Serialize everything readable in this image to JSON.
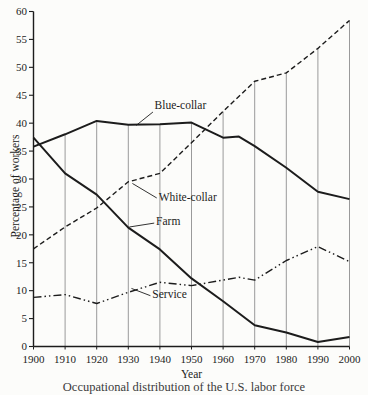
{
  "figure": {
    "background": "#fcfcfa",
    "ink": "#1c1c1c",
    "grid_color": "#8f8f8f"
  },
  "chart_data": {
    "type": "line",
    "title": "",
    "xlabel": "Year",
    "ylabel": "Percentage of workers",
    "xlim": [
      1900,
      2000
    ],
    "ylim": [
      0,
      60
    ],
    "x_ticks": [
      1900,
      1910,
      1920,
      1930,
      1940,
      1950,
      1960,
      1970,
      1980,
      1990,
      2000
    ],
    "y_ticks": [
      0,
      5,
      10,
      15,
      20,
      25,
      30,
      35,
      40,
      45,
      50,
      55,
      60
    ],
    "grid": "vertical guide line at each decade from x-axis up to highest curve",
    "legend_position": "inline-labels",
    "series": [
      {
        "name": "Blue-collar",
        "style": "solid",
        "width": 2,
        "points": [
          [
            1900,
            35.8
          ],
          [
            1910,
            38.0
          ],
          [
            1920,
            40.4
          ],
          [
            1930,
            39.7
          ],
          [
            1940,
            39.8
          ],
          [
            1950,
            40.1
          ],
          [
            1960,
            37.4
          ],
          [
            1965,
            37.6
          ],
          [
            1970,
            35.9
          ],
          [
            1980,
            32.0
          ],
          [
            1990,
            27.7
          ],
          [
            2000,
            26.4
          ]
        ]
      },
      {
        "name": "White-collar",
        "style": "dashed",
        "width": 1.4,
        "points": [
          [
            1900,
            17.5
          ],
          [
            1910,
            21.4
          ],
          [
            1920,
            24.8
          ],
          [
            1930,
            29.5
          ],
          [
            1940,
            31.0
          ],
          [
            1950,
            36.5
          ],
          [
            1960,
            42.1
          ],
          [
            1970,
            47.5
          ],
          [
            1980,
            49.0
          ],
          [
            1990,
            53.4
          ],
          [
            2000,
            58.4
          ]
        ]
      },
      {
        "name": "Farm",
        "style": "solid",
        "width": 2,
        "points": [
          [
            1900,
            37.4
          ],
          [
            1910,
            31.0
          ],
          [
            1920,
            27.2
          ],
          [
            1930,
            21.3
          ],
          [
            1940,
            17.4
          ],
          [
            1950,
            12.2
          ],
          [
            1960,
            8.1
          ],
          [
            1970,
            3.8
          ],
          [
            1980,
            2.5
          ],
          [
            1990,
            0.8
          ],
          [
            2000,
            1.7
          ]
        ]
      },
      {
        "name": "Service",
        "style": "dash-dot-dot",
        "width": 1.4,
        "points": [
          [
            1900,
            8.8
          ],
          [
            1910,
            9.3
          ],
          [
            1920,
            7.7
          ],
          [
            1930,
            9.7
          ],
          [
            1940,
            11.5
          ],
          [
            1950,
            10.9
          ],
          [
            1960,
            11.9
          ],
          [
            1965,
            12.4
          ],
          [
            1970,
            11.9
          ],
          [
            1980,
            15.4
          ],
          [
            1990,
            17.9
          ],
          [
            2000,
            15.2
          ]
        ]
      }
    ],
    "annotations": [
      {
        "label": "Blue-collar",
        "text_at": [
          1938.3,
          42.5
        ],
        "leader_from": [
          1932.5,
          39.6
        ],
        "leader_to": [
          1937.8,
          42.0
        ]
      },
      {
        "label": "White-collar",
        "text_at": [
          1939.6,
          26.1
        ],
        "leader_from": [
          1931.3,
          29.2
        ],
        "leader_to": [
          1939.0,
          26.6
        ]
      },
      {
        "label": "Farm",
        "text_at": [
          1938.8,
          21.8
        ],
        "leader_from": [
          1930.3,
          21.4
        ],
        "leader_to": [
          1938.2,
          22.1
        ]
      },
      {
        "label": "Service",
        "text_at": [
          1937.6,
          8.6
        ],
        "leader_from": [
          1931.0,
          10.4
        ],
        "leader_to": [
          1937.0,
          9.1
        ]
      }
    ]
  },
  "caption": {
    "text": "Occupational distribution of the U.S. labor force",
    "clipped": true
  }
}
